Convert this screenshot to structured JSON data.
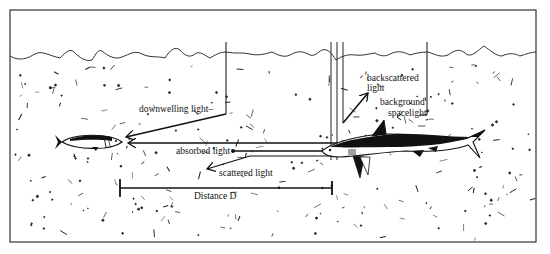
{
  "figure": {
    "labels": {
      "downwelling": "downwelling light–",
      "backscattered_1": "backscattered",
      "backscattered_2": "light",
      "background_1": "background",
      "background_2": "spacelight",
      "absorbed": "absorbed light",
      "scattered": "scattered light",
      "distance": "Distance D"
    },
    "objects": [
      "small fish (target)",
      "shark (observer)"
    ],
    "colors": {
      "ink": "#111111",
      "background": "#ffffff"
    }
  }
}
